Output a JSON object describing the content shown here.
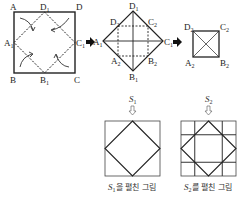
{
  "figure1": {
    "corners": {
      "A": "A",
      "B": "B",
      "C": "C",
      "D": "D"
    },
    "midpoints": {
      "A1": "A",
      "B1": "B",
      "C1": "C",
      "D1": "D"
    },
    "sub1": "1"
  },
  "figure2": {
    "vertices": {
      "A1": "A",
      "C1": "C",
      "D1": "D",
      "B1": "B"
    },
    "inner": {
      "A2": "A",
      "B2": "B",
      "C2": "C",
      "D2": "D"
    },
    "sub1": "1",
    "sub2": "2"
  },
  "figure3": {
    "vertices": {
      "A2": "A",
      "B2": "B",
      "C2": "C",
      "D2": "D"
    },
    "sub2": "2"
  },
  "arrows": [
    "arrow-right",
    "arrow-right"
  ],
  "unfold1": {
    "label": "S",
    "sub": "1",
    "caption_suffix": "을 펼친 그림"
  },
  "unfold2": {
    "label": "S",
    "sub": "2",
    "caption_suffix": "를 펼친 그림"
  }
}
